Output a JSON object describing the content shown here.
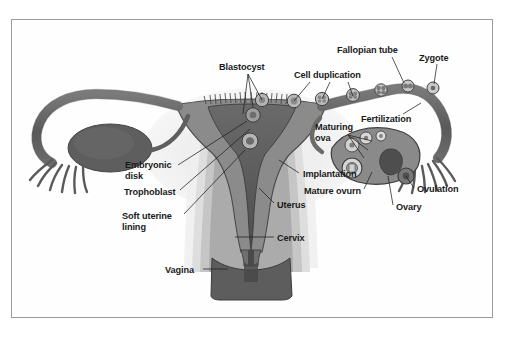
{
  "figure": {
    "type": "anatomical-diagram",
    "style": "grayscale halftone illustration",
    "border_color": "#9a9a9a",
    "background_color": "#ffffff",
    "ink_color": "#1b1b1b"
  },
  "labels": [
    {
      "id": "blastocyst",
      "text": "Blastocyst",
      "x": 219,
      "y": 62,
      "lines": [
        [
          248,
          74,
          243,
          114
        ],
        [
          248,
          74,
          253,
          107
        ],
        [
          248,
          74,
          262,
          100
        ]
      ]
    },
    {
      "id": "fallopian-tube",
      "text": "Fallopian tube",
      "x": 337,
      "y": 45,
      "lines": [
        [
          392,
          57,
          404,
          83
        ]
      ]
    },
    {
      "id": "zygote",
      "text": "Zygote",
      "x": 419,
      "y": 53,
      "lines": [
        [
          437,
          64,
          434,
          84
        ]
      ]
    },
    {
      "id": "cell-duplication",
      "text": "Cell duplication",
      "x": 294,
      "y": 70,
      "lines": [
        [
          310,
          82,
          294,
          101
        ],
        [
          330,
          82,
          322,
          99
        ],
        [
          348,
          82,
          353,
          96
        ]
      ]
    },
    {
      "id": "fertilization",
      "text": "Fertilization",
      "x": 361,
      "y": 114,
      "lines": [
        [
          403,
          114,
          421,
          103
        ]
      ]
    },
    {
      "id": "maturing-ova",
      "text": "Maturing\nova",
      "x": 315,
      "y": 122,
      "lines": [
        [
          348,
          135,
          372,
          141
        ],
        [
          348,
          135,
          368,
          150
        ],
        [
          348,
          135,
          364,
          158
        ]
      ]
    },
    {
      "id": "embryonic-disk",
      "text": "Embryonic\ndisk",
      "x": 125,
      "y": 160,
      "lines": [
        [
          178,
          165,
          247,
          121
        ]
      ]
    },
    {
      "id": "trophoblast",
      "text": "Trophoblast",
      "x": 124,
      "y": 187,
      "lines": [
        [
          180,
          190,
          250,
          129
        ]
      ]
    },
    {
      "id": "soft-uterine-lining",
      "text": "Soft uterine\nlining",
      "x": 122,
      "y": 211,
      "lines": [
        [
          184,
          214,
          245,
          150
        ]
      ]
    },
    {
      "id": "implantation",
      "text": "Implantation",
      "x": 303,
      "y": 169,
      "lines": [
        [
          299,
          173,
          279,
          160
        ]
      ]
    },
    {
      "id": "mature-ovum",
      "text": "Mature ovurn",
      "x": 304,
      "y": 186,
      "lines": [
        [
          364,
          189,
          372,
          172
        ]
      ]
    },
    {
      "id": "uterus",
      "text": "Uterus",
      "x": 277,
      "y": 200,
      "lines": [
        [
          274,
          203,
          259,
          188
        ]
      ]
    },
    {
      "id": "ovary",
      "text": "Ovary",
      "x": 396,
      "y": 202,
      "lines": [
        [
          393,
          205,
          388,
          176
        ]
      ]
    },
    {
      "id": "ovulation",
      "text": "Ovulation",
      "x": 417,
      "y": 184,
      "lines": [
        [
          414,
          188,
          406,
          176
        ]
      ]
    },
    {
      "id": "cervix",
      "text": "Cervix",
      "x": 277,
      "y": 233,
      "lines": [
        [
          274,
          237,
          235,
          237
        ]
      ]
    },
    {
      "id": "vagina",
      "text": "Vagina",
      "x": 165,
      "y": 265,
      "lines": [
        [
          203,
          269,
          228,
          269
        ]
      ]
    }
  ],
  "palette": {
    "tube_dark": "#6e6e6e",
    "tube_outline": "#4a4a4a",
    "uterus_cavity": "#5d5d5d",
    "myometrium": "#8d8d8d",
    "endometrium_mid": "#b0b0b0",
    "serosa_light": "#d4d4d4",
    "halo": "#e8e8e8",
    "ovary_left": "#606060",
    "ovary_right": "#7a7a7a",
    "vagina": "#5a5a5a"
  }
}
